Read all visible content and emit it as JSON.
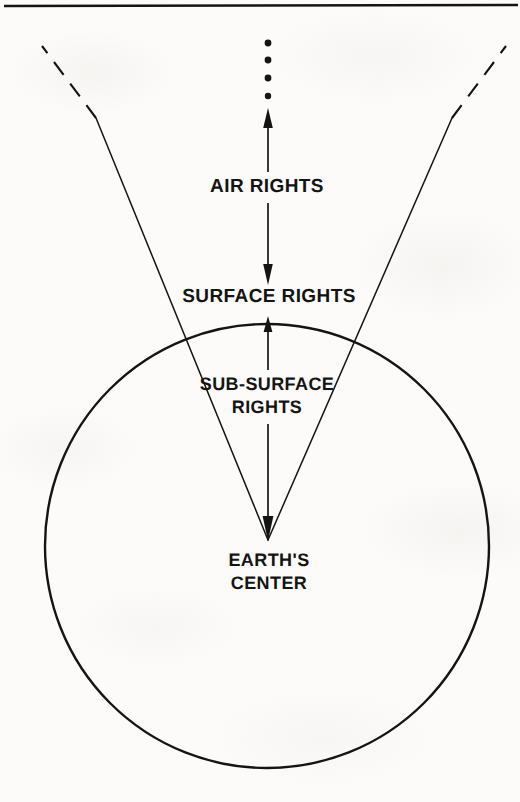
{
  "figure": {
    "type": "cross-section-diagram",
    "top_rule": true,
    "labels": {
      "air_rights": "AIR RIGHTS",
      "surface_rights": "SURFACE RIGHTS",
      "sub_surface_rights_line1": "SUB-SURFACE",
      "sub_surface_rights_line2": "RIGHTS",
      "earths_center_line1": "EARTH'S",
      "earths_center_line2": "CENTER"
    },
    "colors": {
      "ink": "#141414",
      "paper": "#fcfbf9"
    },
    "geometry": {
      "earth_circle": {
        "cx": 267,
        "cy": 546,
        "r": 222
      },
      "apex": {
        "x": 268,
        "y": 540
      },
      "left_ray_top": {
        "x": 42,
        "y": 46
      },
      "right_ray_top": {
        "x": 506,
        "y": 46
      },
      "dashed_segment_end_left": {
        "x": 96,
        "y": 118
      },
      "dashed_segment_end_right": {
        "x": 452,
        "y": 118
      }
    },
    "arrows": [
      {
        "name": "air-rights-up-arrow",
        "from": {
          "x": 268,
          "y": 180
        },
        "to": {
          "x": 268,
          "y": 110
        },
        "direction": "up"
      },
      {
        "name": "air-rights-down-arrow",
        "from": {
          "x": 268,
          "y": 206
        },
        "to": {
          "x": 268,
          "y": 284
        },
        "direction": "down"
      },
      {
        "name": "sub-surface-up-arrow",
        "from": {
          "x": 268,
          "y": 430
        },
        "to": {
          "x": 268,
          "y": 316
        },
        "direction": "up"
      },
      {
        "name": "sub-surface-down-arrow",
        "from": {
          "x": 268,
          "y": 430
        },
        "to": {
          "x": 268,
          "y": 540
        },
        "direction": "down"
      }
    ],
    "dots_above_arrow": {
      "count": 4,
      "meaning": "continues-indefinitely"
    }
  }
}
